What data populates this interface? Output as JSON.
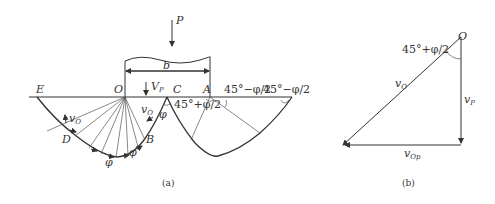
{
  "figure_a": {
    "caption": "(a)",
    "load_label": "P",
    "width_label": "b",
    "velocity_label": "V",
    "velocity_sub": "P",
    "points": {
      "E": "E",
      "O": "O",
      "C": "C",
      "A": "A",
      "D": "D",
      "B": "B"
    },
    "angle_c": "45°+φ/2",
    "angle_a1": "45°−φ/2",
    "angle_a2": "45°−φ/2",
    "v_o_left": "v",
    "v_o_left_sub": "O",
    "v_o_right": "v",
    "v_o_right_sub": "O",
    "phi_labels": [
      "φ",
      "φ",
      "φ",
      "φ"
    ]
  },
  "figure_b": {
    "caption": "(b)",
    "point_o": "O",
    "angle": "45°+φ/2",
    "v_o": "v",
    "v_o_sub": "O",
    "v_p": "v",
    "v_p_sub": "P",
    "v_op": "v",
    "v_op_sub": "Op"
  }
}
